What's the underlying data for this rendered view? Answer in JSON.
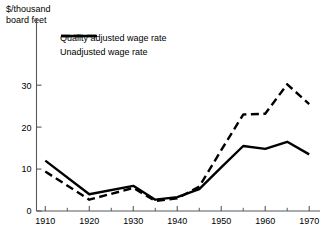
{
  "chart_data": {
    "type": "line",
    "title": "",
    "ylabel": "$/thousand\nboard feet",
    "xlabel": "",
    "xlim": [
      1908,
      1972
    ],
    "ylim": [
      0,
      36
    ],
    "grid": false,
    "legend_position": "top-left",
    "yticks": [
      0,
      10,
      20,
      30
    ],
    "ytick_labels": [
      "0",
      "10",
      "20",
      "30"
    ],
    "xticks": [
      1910,
      1920,
      1930,
      1940,
      1950,
      1960,
      1970
    ],
    "xtick_labels": [
      "1910",
      "1920",
      "1930",
      "1940",
      "1950",
      "1960",
      "1970"
    ],
    "xminorticks": [
      1915,
      1925,
      1935,
      1945,
      1955,
      1965
    ],
    "x": [
      1910,
      1920,
      1930,
      1935,
      1940,
      1945,
      1950,
      1955,
      1960,
      1965,
      1970
    ],
    "series": [
      {
        "name": "Quality adjusted wage rate",
        "style": "dashed",
        "color": "#000000",
        "values": [
          9.4,
          2.7,
          5.5,
          2.4,
          3.0,
          5.8,
          14.5,
          23.0,
          23.2,
          30.2,
          25.5
        ]
      },
      {
        "name": "Unadjusted wage rate",
        "style": "solid",
        "color": "#000000",
        "values": [
          12.0,
          4.0,
          6.0,
          2.7,
          3.3,
          5.2,
          10.4,
          15.5,
          14.8,
          16.5,
          13.5
        ]
      }
    ]
  },
  "legend": {
    "items": [
      {
        "label": "Quality adjusted wage rate",
        "style": "dashed"
      },
      {
        "label": "Unadjusted wage rate",
        "style": "solid"
      }
    ]
  },
  "axis": {
    "y_title_line1": "$/thousand",
    "y_title_line2": "board feet"
  }
}
